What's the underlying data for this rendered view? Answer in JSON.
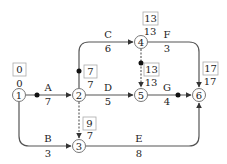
{
  "diagram": {
    "type": "activity-on-arrow network",
    "nodes": [
      {
        "id": "1",
        "label": "1",
        "earliest": "0",
        "latest": "0"
      },
      {
        "id": "2",
        "label": "2",
        "earliest": "7",
        "latest": "7"
      },
      {
        "id": "3",
        "label": "3",
        "earliest": "7",
        "latest": "9"
      },
      {
        "id": "4",
        "label": "4",
        "earliest": "13",
        "latest": "13"
      },
      {
        "id": "5",
        "label": "5",
        "earliest": "13",
        "latest": "13"
      },
      {
        "id": "6",
        "label": "6",
        "earliest": "17",
        "latest": "17"
      }
    ],
    "activities": [
      {
        "name": "A",
        "duration": "7",
        "from": "1",
        "to": "2",
        "critical": true
      },
      {
        "name": "B",
        "duration": "3",
        "from": "1",
        "to": "3",
        "critical": false
      },
      {
        "name": "C",
        "duration": "6",
        "from": "2",
        "to": "4",
        "critical": true
      },
      {
        "name": "D",
        "duration": "5",
        "from": "2",
        "to": "5",
        "critical": false
      },
      {
        "name": "E",
        "duration": "8",
        "from": "3",
        "to": "6",
        "critical": false
      },
      {
        "name": "F",
        "duration": "3",
        "from": "4",
        "to": "6",
        "critical": false
      },
      {
        "name": "G",
        "duration": "4",
        "from": "5",
        "to": "6",
        "critical": true
      }
    ],
    "dummies": [
      {
        "from": "2",
        "to": "3"
      },
      {
        "from": "4",
        "to": "5",
        "critical": true
      }
    ],
    "colors": {
      "line": "#555555",
      "text": "#222222",
      "box": "#aaaaaa"
    }
  }
}
